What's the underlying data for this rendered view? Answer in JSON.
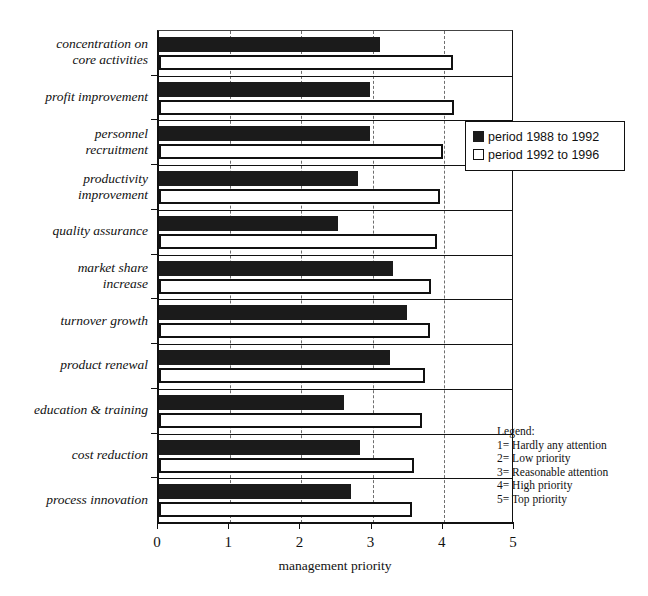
{
  "chart_data": {
    "type": "bar",
    "orientation": "horizontal",
    "title": "",
    "xlabel": "management priority",
    "ylabel": "",
    "xlim": [
      0,
      5
    ],
    "xticks": [
      "0",
      "1",
      "2",
      "3",
      "4",
      "5"
    ],
    "grid": "vertical dashed gridlines at 1,2,3,4",
    "legend_position": "upper right inside plot",
    "categories": [
      "concentration on core activities",
      "profit improvement",
      "personnel recruitment",
      "productivity improvement",
      "quality assurance",
      "market share increase",
      "turnover growth",
      "product renewal",
      "education & training",
      "cost reduction",
      "process innovation"
    ],
    "category_lines": [
      [
        "concentration on",
        "core activities"
      ],
      [
        "profit improvement"
      ],
      [
        "personnel",
        "recruitment"
      ],
      [
        "productivity",
        "improvement"
      ],
      [
        "quality assurance"
      ],
      [
        "market share",
        "increase"
      ],
      [
        "turnover growth"
      ],
      [
        "product renewal"
      ],
      [
        "education & training"
      ],
      [
        "cost reduction"
      ],
      [
        "process innovation"
      ]
    ],
    "series": [
      {
        "name": "period 1988 to 1992",
        "color": "#1b1b1b",
        "style": "filled",
        "values": [
          3.1,
          2.97,
          2.97,
          2.79,
          2.52,
          3.28,
          3.49,
          3.25,
          2.6,
          2.83,
          2.69
        ]
      },
      {
        "name": "period 1992 to 1996",
        "color": "#ffffff",
        "style": "outlined",
        "values": [
          4.13,
          4.15,
          3.99,
          3.94,
          3.9,
          3.82,
          3.8,
          3.73,
          3.7,
          3.58,
          3.55
        ]
      }
    ]
  },
  "series_legend": {
    "items": [
      {
        "label": "period 1988 to 1992",
        "swatch": "dark"
      },
      {
        "label": "period 1992 to 1996",
        "swatch": "light"
      }
    ]
  },
  "scale_legend": {
    "heading": "Legend:",
    "lines": [
      "1= Hardly any attention",
      "2= Low priority",
      "3= Reasonable attention",
      "4= High priority",
      "5= Top priority"
    ]
  },
  "axis": {
    "title": "management priority",
    "tick_labels": [
      "0",
      "1",
      "2",
      "3",
      "4",
      "5"
    ]
  }
}
